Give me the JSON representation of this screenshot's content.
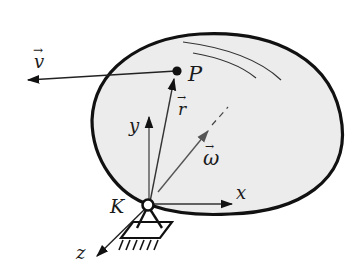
{
  "diagram": {
    "colors": {
      "body_fill": "#ececec",
      "outline": "#111111",
      "gray_vector": "#555555",
      "background": "#ffffff"
    },
    "labels": {
      "v": "v",
      "P": "P",
      "r": "r",
      "y": "y",
      "omega": "ω",
      "x": "x",
      "K": "K",
      "z": "z"
    },
    "vector_marks": {
      "v": "→",
      "r": "→",
      "omega": "→"
    }
  }
}
